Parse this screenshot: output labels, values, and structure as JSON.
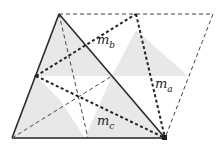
{
  "diagram": {
    "labels": {
      "mb": {
        "base": "m",
        "sub": "b"
      },
      "ma": {
        "base": "m",
        "sub": "a"
      },
      "mc": {
        "base": "m",
        "sub": "c"
      }
    },
    "points": {
      "apex": [
        59,
        14
      ],
      "base_left": [
        12,
        138
      ],
      "base_right": [
        165,
        138
      ],
      "top_mid": [
        136,
        14
      ],
      "top_right": [
        213,
        14
      ],
      "left_mid": [
        36,
        76
      ]
    },
    "colors": {
      "solid_line": "#2a2a2a",
      "dashed_line": "#333333",
      "shade": "#e6e6e6"
    }
  }
}
